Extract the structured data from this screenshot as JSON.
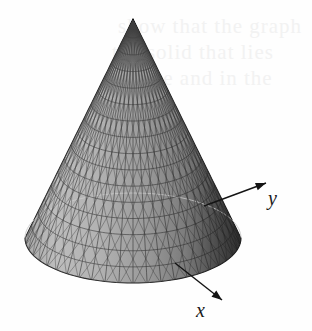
{
  "figure": {
    "caption_alt": "Wireframe shaded cone surface with x and y axis arrows",
    "background_color": "#fefefe",
    "ink_color": "#1a1a1a"
  },
  "axes": [
    {
      "name": "y-axis",
      "label": "y",
      "direction": "up-right",
      "arrow_from": [
        204,
        206
      ],
      "arrow_to": [
        266,
        183
      ]
    },
    {
      "name": "x-axis",
      "label": "x",
      "direction": "down-right",
      "arrow_from": [
        175,
        263
      ],
      "arrow_to": [
        222,
        300
      ]
    }
  ],
  "surface": {
    "type": "cone",
    "apex": [
      131,
      19
    ],
    "base_center": [
      133,
      238
    ],
    "base_radius_x": 108,
    "base_radius_y": 45,
    "mesh": {
      "radial_lines": 48,
      "ring_lines": 16,
      "line_color": "#262626"
    },
    "shading": {
      "highlight": "#b4b4b4",
      "midtone": "#8c8c8c",
      "shadow": "#3a3a3a",
      "light_from": "left"
    }
  },
  "ghost_text": {
    "visible": true,
    "color": "#f2f2f2",
    "lines": [
      {
        "text": "show that the graph",
        "x": 118,
        "y": 14
      },
      {
        "text": "the solid that lies",
        "x": 112,
        "y": 40
      },
      {
        "text": "surface and in the",
        "x": 106,
        "y": 66
      }
    ]
  },
  "chart_data": {
    "type": "surface",
    "title": "",
    "xlabel": "x",
    "ylabel": "y",
    "zlabel": "",
    "equation": "z = c - sqrt(x^2 + y^2)",
    "projection": "orthographic-3d",
    "grid": true,
    "legend": "none"
  }
}
